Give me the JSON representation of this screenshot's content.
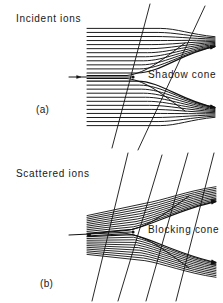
{
  "figure": {
    "width": 223,
    "height": 303,
    "background_color": "#ffffff",
    "ink_color": "#111111"
  },
  "panels": [
    {
      "id": "a",
      "tag": "(a)",
      "heading": "Incident ions",
      "cone_label": "Shadow cone",
      "description": "Parallel incident ion trajectories deflected by a repulsive scattering centre, leaving an empty shadow cone behind the atom.",
      "scattering_center": {
        "x": 133,
        "y": 77
      },
      "beam": {
        "kind": "parallel",
        "direction": "left-to-right",
        "ray_count": 24,
        "start_x": 87,
        "top_y": 30,
        "bottom_y": 124,
        "spacing_px": 4.1
      },
      "cone": {
        "apex": {
          "x": 133,
          "y": 77
        },
        "opens": "right",
        "half_angle_deg": 17
      },
      "crossing_lines": 4
    },
    {
      "id": "b",
      "tag": "(b)",
      "heading": "Scattered ions",
      "cone_label": "Blocking cone",
      "description": "Ions scattered from a source atom are blocked by a neighbouring atom, producing an empty blocking cone along the atom row.",
      "scattering_center": {
        "x": 133,
        "y": 232
      },
      "beam": {
        "kind": "divergent",
        "direction": "left-to-right",
        "ray_count": 22,
        "source": {
          "x": 95,
          "y": 235
        },
        "start_x": 87,
        "top_y": 185,
        "bottom_y": 286,
        "spacing_px": 4.4
      },
      "cone": {
        "apex": {
          "x": 133,
          "y": 232
        },
        "opens": "right",
        "half_angle_deg": 17
      },
      "crossing_lines": 5
    }
  ],
  "markers": {
    "dot_label": "atom",
    "dot_radius_px": 1.6
  },
  "chart_data": {
    "type": "diagram",
    "subplots": [
      {
        "tag": "(a)",
        "heading": "Incident ions",
        "annotation": "Shadow cone",
        "beam_type": "parallel",
        "ray_count": 24
      },
      {
        "tag": "(b)",
        "heading": "Scattered ions",
        "annotation": "Blocking cone",
        "beam_type": "divergent",
        "ray_count": 22
      }
    ]
  }
}
